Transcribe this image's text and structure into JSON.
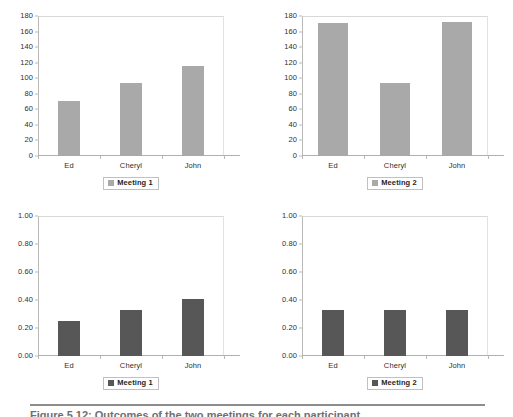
{
  "figure": {
    "caption": "Figure 5.12:  Outcomes of the two meetings for each participant.",
    "rule_color": "#8d8d8d"
  },
  "colors": {
    "bar_light": "#a9a9a9",
    "bar_dark": "#575757",
    "axis": "#b0b0b0",
    "text": "#2f2f2f"
  },
  "chart_data": [
    {
      "type": "bar",
      "panel": "top-left",
      "title": "",
      "xlabel": "",
      "ylabel": "",
      "categories": [
        "Ed",
        "Cheryl",
        "John"
      ],
      "values": [
        71,
        94,
        116
      ],
      "ylim": [
        0,
        180
      ],
      "yticks": [
        0,
        20,
        40,
        60,
        80,
        100,
        120,
        140,
        160,
        180
      ],
      "ytick_labels": [
        "0",
        "20",
        "40",
        "60",
        "80",
        "100",
        "120",
        "140",
        "160",
        "180"
      ],
      "legend": [
        "Meeting 1"
      ],
      "legend_position": "bottom",
      "grid": false,
      "bar_color": "#a9a9a9"
    },
    {
      "type": "bar",
      "panel": "top-right",
      "title": "",
      "xlabel": "",
      "ylabel": "",
      "categories": [
        "Ed",
        "Cheryl",
        "John"
      ],
      "values": [
        171,
        94,
        172
      ],
      "ylim": [
        0,
        180
      ],
      "yticks": [
        0,
        20,
        40,
        60,
        80,
        100,
        120,
        140,
        160,
        180
      ],
      "ytick_labels": [
        "0",
        "20",
        "40",
        "60",
        "80",
        "100",
        "120",
        "140",
        "160",
        "180"
      ],
      "legend": [
        "Meeting 2"
      ],
      "legend_position": "bottom",
      "grid": false,
      "bar_color": "#a9a9a9"
    },
    {
      "type": "bar",
      "panel": "bottom-left",
      "title": "",
      "xlabel": "",
      "ylabel": "",
      "categories": [
        "Ed",
        "Cheryl",
        "John"
      ],
      "values": [
        0.25,
        0.33,
        0.41
      ],
      "ylim": [
        0,
        1
      ],
      "yticks": [
        0,
        0.2,
        0.4,
        0.6,
        0.8,
        1
      ],
      "ytick_labels": [
        "0.00",
        "0.20",
        "0.40",
        "0.60",
        "0.80",
        "1.00"
      ],
      "legend": [
        "Meeting 1"
      ],
      "legend_position": "bottom",
      "grid": false,
      "bar_color": "#575757"
    },
    {
      "type": "bar",
      "panel": "bottom-right",
      "title": "",
      "xlabel": "",
      "ylabel": "",
      "categories": [
        "Ed",
        "Cheryl",
        "John"
      ],
      "values": [
        0.33,
        0.33,
        0.33
      ],
      "ylim": [
        0,
        1
      ],
      "yticks": [
        0,
        0.2,
        0.4,
        0.6,
        0.8,
        1
      ],
      "ytick_labels": [
        "0.00",
        "0.20",
        "0.40",
        "0.60",
        "0.80",
        "1.00"
      ],
      "legend": [
        "Meeting 2"
      ],
      "legend_position": "bottom",
      "grid": false,
      "bar_color": "#575757"
    }
  ]
}
